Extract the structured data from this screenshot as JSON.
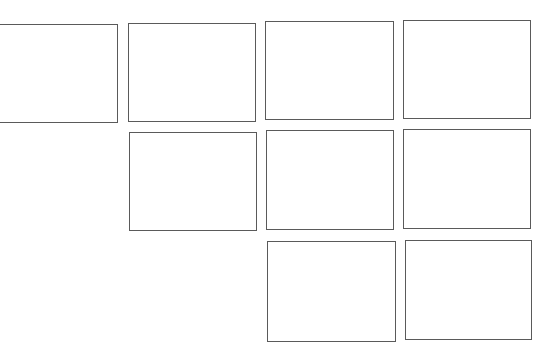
{
  "diagram": {
    "type": "panel-grid-template",
    "background": "#ffffff",
    "border_color": "#5a5a5a",
    "panels": [
      {
        "id": "r1c1",
        "row": 1,
        "col": 1,
        "x": -2,
        "y": 24,
        "w": 120,
        "h": 99,
        "cut_left": true
      },
      {
        "id": "r1c2",
        "row": 1,
        "col": 2,
        "x": 128,
        "y": 23,
        "w": 128,
        "h": 99
      },
      {
        "id": "r1c3",
        "row": 1,
        "col": 3,
        "x": 265,
        "y": 21,
        "w": 129,
        "h": 99
      },
      {
        "id": "r1c4",
        "row": 1,
        "col": 4,
        "x": 403,
        "y": 20,
        "w": 128,
        "h": 99
      },
      {
        "id": "r2c2",
        "row": 2,
        "col": 2,
        "x": 129,
        "y": 132,
        "w": 128,
        "h": 99
      },
      {
        "id": "r2c3",
        "row": 2,
        "col": 3,
        "x": 266,
        "y": 130,
        "w": 128,
        "h": 100
      },
      {
        "id": "r2c4",
        "row": 2,
        "col": 4,
        "x": 403,
        "y": 129,
        "w": 128,
        "h": 100
      },
      {
        "id": "r3c3",
        "row": 3,
        "col": 3,
        "x": 267,
        "y": 241,
        "w": 129,
        "h": 101
      },
      {
        "id": "r3c4",
        "row": 3,
        "col": 4,
        "x": 405,
        "y": 240,
        "w": 127,
        "h": 100
      }
    ]
  }
}
